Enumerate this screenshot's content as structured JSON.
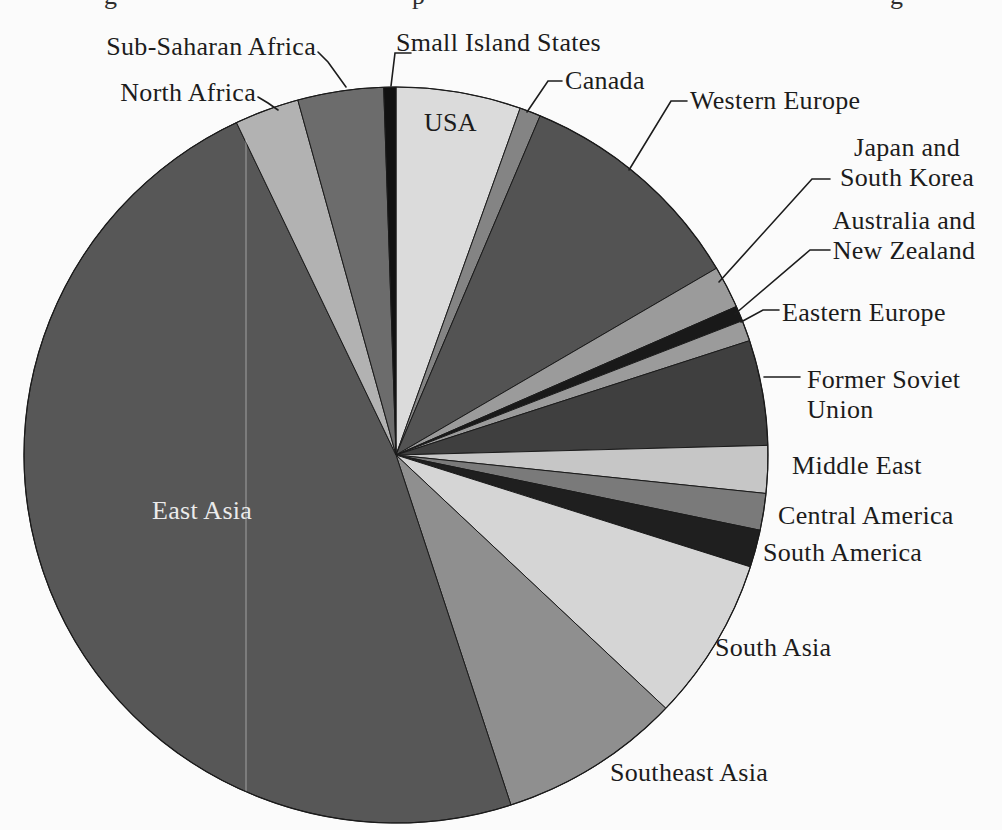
{
  "figure": {
    "kind": "scanned-book-pie-chart",
    "background": "#fbfbfb",
    "cropped_caption": {
      "note": "only descenders of a cut-off caption line are visible at top edge",
      "fragments": [
        {
          "glyph": "g",
          "x": 104
        },
        {
          "glyph": "p",
          "x": 412
        },
        {
          "glyph": "g",
          "x": 890
        }
      ]
    }
  },
  "chart_data": {
    "type": "pie",
    "title": "",
    "legend_position": "none",
    "angle_zero": "12-oclock",
    "direction": "clockwise",
    "center_x": 396,
    "center_y": 455,
    "radius_x": 372,
    "radius_y": 368,
    "stroke_color": "#1b1b1b",
    "leader_color": "#1c1c1c",
    "slices": [
      {
        "label": "USA",
        "start_deg": 0.0,
        "end_deg": 19.5,
        "percent_est": 5.4,
        "color": "#dbdbdb",
        "label_placement": "inside",
        "label_x": 424,
        "label_y": 108,
        "label_align": "left",
        "label_color": "#1c1c1c",
        "leader": null
      },
      {
        "label": "Canada",
        "start_deg": 19.5,
        "end_deg": 22.8,
        "percent_est": 0.9,
        "color": "#848484",
        "label_placement": "outside",
        "label_x": 565,
        "label_y": 66,
        "label_align": "left",
        "label_color": "#1c1c1c",
        "leader": [
          [
            562,
            81
          ],
          [
            548,
            81
          ],
          [
            527,
            112
          ]
        ]
      },
      {
        "label": "Western Europe",
        "start_deg": 22.8,
        "end_deg": 59.5,
        "percent_est": 10.2,
        "color": "#535353",
        "label_placement": "outside",
        "label_x": 690,
        "label_y": 86,
        "label_align": "left",
        "label_color": "#1c1c1c",
        "leader": [
          [
            687,
            101
          ],
          [
            671,
            101
          ],
          [
            629,
            170
          ]
        ]
      },
      {
        "label": "Japan and South Korea",
        "label_lines": [
          "Japan and",
          "South Korea"
        ],
        "start_deg": 59.5,
        "end_deg": 66.2,
        "percent_est": 1.9,
        "color": "#9b9b9b",
        "label_placement": "outside",
        "label_x": 907,
        "label_y": 133,
        "label_align": "center",
        "label_color": "#1c1c1c",
        "leader": [
          [
            830,
            179
          ],
          [
            812,
            179
          ],
          [
            719,
            282
          ]
        ]
      },
      {
        "label": "Australia and New Zealand",
        "label_lines": [
          "Australia and",
          "New Zealand"
        ],
        "start_deg": 66.2,
        "end_deg": 68.6,
        "percent_est": 0.7,
        "color": "#191919",
        "label_placement": "outside",
        "label_x": 904,
        "label_y": 206,
        "label_align": "center",
        "label_color": "#1c1c1c",
        "leader": [
          [
            830,
            250
          ],
          [
            810,
            250
          ],
          [
            735,
            314
          ]
        ]
      },
      {
        "label": "Eastern Europe",
        "start_deg": 68.6,
        "end_deg": 71.9,
        "percent_est": 0.9,
        "color": "#9b9b9b",
        "label_placement": "outside",
        "label_x": 782,
        "label_y": 298,
        "label_align": "left",
        "label_color": "#1c1c1c",
        "leader": [
          [
            779,
            310
          ],
          [
            763,
            310
          ],
          [
            741,
            322
          ]
        ]
      },
      {
        "label": "Former Soviet Union",
        "label_lines": [
          "Former Soviet",
          "Union"
        ],
        "start_deg": 71.9,
        "end_deg": 88.5,
        "percent_est": 4.6,
        "color": "#3f3f3f",
        "label_placement": "outside",
        "label_x": 807,
        "label_y": 365,
        "label_align": "left",
        "label_color": "#1c1c1c",
        "leader": [
          [
            800,
            377
          ],
          [
            764,
            377
          ]
        ]
      },
      {
        "label": "Middle East",
        "start_deg": 88.5,
        "end_deg": 96.0,
        "percent_est": 2.1,
        "color": "#c6c6c6",
        "label_placement": "outside",
        "label_x": 792,
        "label_y": 451,
        "label_align": "left",
        "label_color": "#1c1c1c",
        "leader": null
      },
      {
        "label": "Central America",
        "start_deg": 96.0,
        "end_deg": 101.8,
        "percent_est": 1.6,
        "color": "#7a7a7a",
        "label_placement": "outside",
        "label_x": 778,
        "label_y": 501,
        "label_align": "left",
        "label_color": "#1c1c1c",
        "leader": null
      },
      {
        "label": "South America",
        "start_deg": 101.8,
        "end_deg": 107.7,
        "percent_est": 1.6,
        "color": "#1f1f1f",
        "label_placement": "outside",
        "label_x": 763,
        "label_y": 538,
        "label_align": "left",
        "label_color": "#1c1c1c",
        "leader": null
      },
      {
        "label": "South Asia",
        "start_deg": 107.7,
        "end_deg": 133.5,
        "percent_est": 7.2,
        "color": "#d5d5d5",
        "label_placement": "outside",
        "label_x": 715,
        "label_y": 633,
        "label_align": "left",
        "label_color": "#1c1c1c",
        "leader": null
      },
      {
        "label": "Southeast Asia",
        "start_deg": 133.5,
        "end_deg": 162.0,
        "percent_est": 7.9,
        "color": "#8f8f8f",
        "label_placement": "outside",
        "label_x": 610,
        "label_y": 758,
        "label_align": "left",
        "label_color": "#1c1c1c",
        "leader": null
      },
      {
        "label": "East Asia",
        "start_deg": 162.0,
        "end_deg": 334.6,
        "percent_est": 47.9,
        "color": "#575757",
        "label_placement": "inside",
        "label_x": 152,
        "label_y": 496,
        "label_align": "left",
        "label_color": "#ebebeb",
        "leader": null
      },
      {
        "label": "North Africa",
        "start_deg": 334.6,
        "end_deg": 344.7,
        "percent_est": 2.8,
        "color": "#b2b2b2",
        "label_placement": "outside",
        "label_x": 256,
        "label_y": 78,
        "label_align": "right",
        "label_color": "#1c1c1c",
        "leader": [
          [
            258,
            97
          ],
          [
            268,
            103
          ],
          [
            278,
            110
          ]
        ]
      },
      {
        "label": "Sub-Saharan Africa",
        "start_deg": 344.7,
        "end_deg": 358.1,
        "percent_est": 3.7,
        "color": "#6c6c6c",
        "label_placement": "outside",
        "label_x": 316,
        "label_y": 32,
        "label_align": "right",
        "label_color": "#1c1c1c",
        "leader": [
          [
            318,
            52
          ],
          [
            328,
            62
          ],
          [
            346,
            87
          ]
        ]
      },
      {
        "label": "Small Island States",
        "start_deg": 358.1,
        "end_deg": 360.0,
        "percent_est": 0.5,
        "color": "#111111",
        "label_placement": "outside",
        "label_x": 396,
        "label_y": 28,
        "label_align": "left",
        "label_color": "#1c1c1c",
        "leader": [
          [
            411,
            53
          ],
          [
            395,
            53
          ],
          [
            391,
            86
          ]
        ]
      }
    ],
    "scan_artifact_line": {
      "x": 246,
      "y1": 140,
      "y2": 800,
      "color": "rgba(255,255,255,0.3)"
    }
  }
}
